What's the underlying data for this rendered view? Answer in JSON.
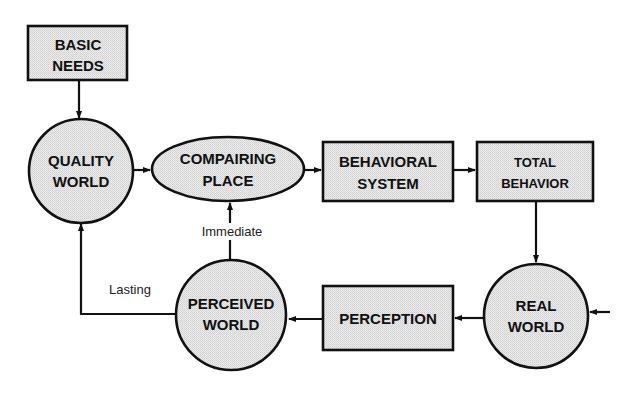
{
  "diagram": {
    "fill_color": "#e4e4e4",
    "stroke_color": "#111111",
    "nodes": {
      "basic_needs": {
        "shape": "rectangle",
        "line1": "BASIC",
        "line2": "NEEDS"
      },
      "quality_world": {
        "shape": "circle",
        "line1": "QUALITY",
        "line2": "WORLD"
      },
      "compairing_place": {
        "shape": "ellipse",
        "line1": "COMPAIRING",
        "line2": "PLACE"
      },
      "behavioral_system": {
        "shape": "rectangle",
        "line1": "BEHAVIORAL",
        "line2": "SYSTEM"
      },
      "total_behavior": {
        "shape": "rectangle",
        "line1": "TOTAL",
        "line2": "BEHAVIOR"
      },
      "real_world": {
        "shape": "circle",
        "line1": "REAL",
        "line2": "WORLD"
      },
      "perception": {
        "shape": "rectangle",
        "line1": "PERCEPTION"
      },
      "perceived_world": {
        "shape": "circle",
        "line1": "PERCEIVED",
        "line2": "WORLD"
      }
    },
    "edges": [
      {
        "from": "basic_needs",
        "to": "quality_world",
        "label": ""
      },
      {
        "from": "quality_world",
        "to": "compairing_place",
        "label": ""
      },
      {
        "from": "compairing_place",
        "to": "behavioral_system",
        "label": ""
      },
      {
        "from": "behavioral_system",
        "to": "total_behavior",
        "label": ""
      },
      {
        "from": "total_behavior",
        "to": "real_world",
        "label": ""
      },
      {
        "from": "external",
        "to": "real_world",
        "label": ""
      },
      {
        "from": "real_world",
        "to": "perception",
        "label": ""
      },
      {
        "from": "perception",
        "to": "perceived_world",
        "label": ""
      },
      {
        "from": "perceived_world",
        "to": "compairing_place",
        "label": "Immediate"
      },
      {
        "from": "perceived_world",
        "to": "quality_world",
        "label": "Lasting"
      }
    ],
    "labels": {
      "immediate": "Immediate",
      "lasting": "Lasting"
    }
  }
}
